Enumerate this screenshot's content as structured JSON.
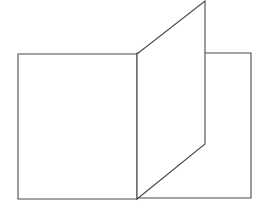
{
  "diagram": {
    "canvas": {
      "width": 267,
      "height": 213,
      "background": "#ffffff"
    },
    "stroke_color": "#4a4a4a",
    "shapes": {
      "left_rectangle": {
        "points": "18,54 137,54 137,199 18,199"
      },
      "right_rectangle": {
        "points": "137,53 251,53 251,198 137,198"
      },
      "slanted_panel": {
        "points": "137,54 205,1 205,144 137,199"
      }
    }
  }
}
